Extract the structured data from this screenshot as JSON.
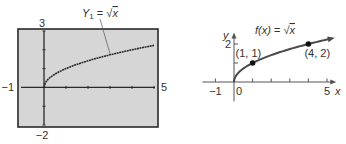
{
  "chart_data": [
    {
      "type": "line",
      "title": "Graphing calculator screen",
      "function_label": "Y₁ = √x",
      "function_label_parts": {
        "name": "Y",
        "sub": "1",
        "eq": " = ",
        "rad": "√",
        "arg": "x"
      },
      "xlim": [
        -1,
        5
      ],
      "ylim": [
        -2,
        3
      ],
      "x_ticks": [
        0,
        1,
        2,
        3,
        4,
        5
      ],
      "y_ticks": [
        -2,
        -1,
        0,
        1,
        2,
        3
      ],
      "window_labels": {
        "xmin": "−1",
        "xmax": "5",
        "ymin": "−2",
        "ymax": "3"
      },
      "series": [
        {
          "name": "Y1 = sqrt(x)",
          "function": "sqrt",
          "domain": [
            0,
            5
          ]
        }
      ],
      "colors": {
        "screen": "#d6d6d6",
        "border": "#2a2a2a",
        "curve": "#2a2a2a"
      }
    },
    {
      "type": "line",
      "title": "f(x) = √x",
      "function_label_parts": {
        "name": "f(x)",
        "eq": " = ",
        "rad": "√",
        "arg": "x"
      },
      "xlabel": "x",
      "ylabel": "y",
      "xlim": [
        -1.7,
        5.5
      ],
      "ylim": [
        -0.6,
        2.6
      ],
      "x_ticks": [
        -1,
        1,
        2,
        3,
        4,
        5
      ],
      "y_ticks": [
        1,
        2
      ],
      "x_tick_labels": [
        {
          "value": -1,
          "text": "−1"
        },
        {
          "value": 0,
          "text": "0"
        },
        {
          "value": 5,
          "text": "5"
        }
      ],
      "y_tick_labels": [
        {
          "value": 2,
          "text": "2"
        }
      ],
      "series": [
        {
          "name": "f(x) = sqrt(x)",
          "function": "sqrt",
          "domain": [
            0,
            5.1
          ]
        }
      ],
      "points": [
        {
          "x": 1,
          "y": 1,
          "label": "(1, 1)"
        },
        {
          "x": 4,
          "y": 2,
          "label": "(4, 2)"
        }
      ],
      "colors": {
        "curve": "#4a4a4a",
        "axis": "#555555",
        "point": "#111111"
      }
    }
  ]
}
